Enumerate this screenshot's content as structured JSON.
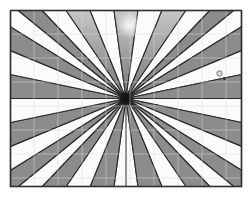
{
  "canvas": {
    "width": 252,
    "height": 200,
    "background": "#ffffff"
  },
  "graphic": {
    "description": "starburst-fan-drawing",
    "frame": {
      "x": 10.5,
      "y": 10.5,
      "width": 231,
      "height": 176,
      "stroke": "#2e2e2e",
      "stroke_width": 1.6,
      "fill": "#fbfbfb"
    },
    "center": {
      "x": 126,
      "y": 98.5
    },
    "rays": {
      "segments": 34,
      "gray_count": 17,
      "gray_fill": "#8c8c8c",
      "white_fill": "#fbfbfb",
      "outline": "#2a2a2a",
      "outline_width": 1.1,
      "gradient_segments": [
        15,
        17,
        19
      ],
      "gradient_top": "#c6c6c6",
      "gradient_bottom": "#828282"
    },
    "grid": {
      "spacing": 24,
      "start_x": 34,
      "start_y": 34,
      "color": "#d9d9d9",
      "opacity": 0.5
    },
    "glow": {
      "x": 130,
      "y": 25,
      "radius": 14,
      "color": "#ffffff"
    },
    "center_blob": {
      "radius": 8,
      "color": "#141414"
    },
    "crease": {
      "x1": 126,
      "y1": 98.5,
      "x2": 126,
      "y2": 186.5,
      "color": "#2b2b2b",
      "width": 1
    },
    "handles": {
      "circle": {
        "x": 219.5,
        "y": 73.5,
        "r": 2.7,
        "fill": "#d8d8d8",
        "stroke": "#5c5c5c",
        "stroke_width": 0.8
      },
      "square": {
        "x": 223.2,
        "y": 77.2,
        "size": 2.8,
        "fill": "#3b3b3b"
      }
    }
  }
}
